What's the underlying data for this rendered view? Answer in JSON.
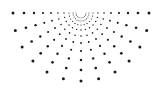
{
  "graphic": {
    "name": "half-sunburst-dots",
    "color": "#1a1a1a",
    "background": "#ffffff",
    "center": [
      81,
      13
    ],
    "rays": 13,
    "angle_start_deg": 0,
    "angle_end_deg": 180,
    "radii": [
      5,
      8,
      12,
      17,
      23,
      30,
      38,
      47,
      57,
      68
    ],
    "dot_sizes": [
      0.45,
      0.5,
      0.6,
      0.7,
      0.8,
      0.9,
      1.05,
      1.2,
      1.35,
      1.5
    ]
  }
}
